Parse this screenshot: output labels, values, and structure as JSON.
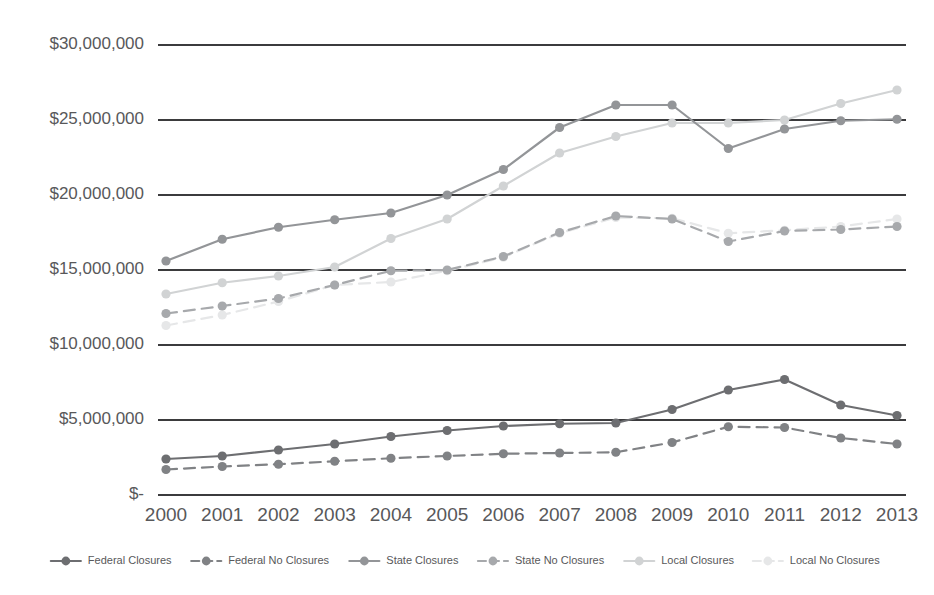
{
  "chart_data": {
    "type": "line",
    "title": "",
    "subtitle": "",
    "xlabel": "",
    "ylabel": "",
    "categories": [
      "2000",
      "2001",
      "2002",
      "2003",
      "2004",
      "2005",
      "2006",
      "2007",
      "2008",
      "2009",
      "2010",
      "2011",
      "2012",
      "2013"
    ],
    "x": [
      2000,
      2001,
      2002,
      2003,
      2004,
      2005,
      2006,
      2007,
      2008,
      2009,
      2010,
      2011,
      2012,
      2013
    ],
    "ylim": [
      0,
      30000000
    ],
    "ytick_values": [
      0,
      5000000,
      10000000,
      15000000,
      20000000,
      25000000,
      30000000
    ],
    "ytick_labels": [
      "$-",
      "$5,000,000",
      "$10,000,000",
      "$15,000,000",
      "$20,000,000",
      "$25,000,000",
      "$30,000,000"
    ],
    "grid": true,
    "grid_axis": "y",
    "legend_position": "bottom",
    "series": [
      {
        "name": "Federal Closures",
        "color": "#6d6e71",
        "dash": "none",
        "marker": "circle",
        "values": [
          2400000,
          2600000,
          3000000,
          3400000,
          3900000,
          4300000,
          4600000,
          4750000,
          4800000,
          5700000,
          7000000,
          7700000,
          6000000,
          5300000
        ]
      },
      {
        "name": "Federal No Closures",
        "color": "#808285",
        "dash": "dashed",
        "marker": "circle",
        "values": [
          1700000,
          1900000,
          2050000,
          2250000,
          2450000,
          2600000,
          2750000,
          2800000,
          2850000,
          3500000,
          4550000,
          4500000,
          3800000,
          3400000
        ]
      },
      {
        "name": "State Closures",
        "color": "#939598",
        "dash": "none",
        "marker": "circle",
        "values": [
          15600000,
          17050000,
          17850000,
          18350000,
          18800000,
          20000000,
          21700000,
          24500000,
          26000000,
          26000000,
          23100000,
          24400000,
          24950000,
          25050000
        ]
      },
      {
        "name": "State No Closures",
        "color": "#a7a9ac",
        "dash": "dashed",
        "marker": "circle",
        "values": [
          12100000,
          12600000,
          13100000,
          14000000,
          14950000,
          15000000,
          15900000,
          17500000,
          18600000,
          18400000,
          16900000,
          17600000,
          17700000,
          17900000
        ]
      },
      {
        "name": "Local Closures",
        "color": "#d1d3d4",
        "dash": "none",
        "marker": "circle",
        "values": [
          13400000,
          14150000,
          14600000,
          15200000,
          17100000,
          18400000,
          20600000,
          22800000,
          23900000,
          24800000,
          24800000,
          25000000,
          26100000,
          27000000
        ]
      },
      {
        "name": "Local No Closures",
        "color": "#e6e7e8",
        "dash": "dashed",
        "marker": "circle",
        "values": [
          11300000,
          12000000,
          12900000,
          14000000,
          14200000,
          14950000,
          15850000,
          17450000,
          18500000,
          18450000,
          17450000,
          17650000,
          17900000,
          18400000
        ]
      }
    ]
  },
  "axis": {
    "y_labels": [
      "$30,000,000",
      "$25,000,000",
      "$20,000,000",
      "$15,000,000",
      "$10,000,000",
      "$5,000,000",
      "$-"
    ],
    "x_labels": [
      "2000",
      "2001",
      "2002",
      "2003",
      "2004",
      "2005",
      "2006",
      "2007",
      "2008",
      "2009",
      "2010",
      "2011",
      "2012",
      "2013"
    ]
  },
  "legend": {
    "items": [
      {
        "label": "Federal Closures",
        "color": "#6d6e71",
        "dash": "none"
      },
      {
        "label": "Federal No Closures",
        "color": "#808285",
        "dash": "dashed"
      },
      {
        "label": "State Closures",
        "color": "#939598",
        "dash": "none"
      },
      {
        "label": "State No Closures",
        "color": "#a7a9ac",
        "dash": "dashed"
      },
      {
        "label": "Local Closures",
        "color": "#d1d3d4",
        "dash": "none"
      },
      {
        "label": "Local No Closures",
        "color": "#e6e7e8",
        "dash": "dashed"
      }
    ]
  },
  "colors": {
    "gridline": "#3b3b3d",
    "text": "#58585a",
    "background": "#ffffff"
  }
}
